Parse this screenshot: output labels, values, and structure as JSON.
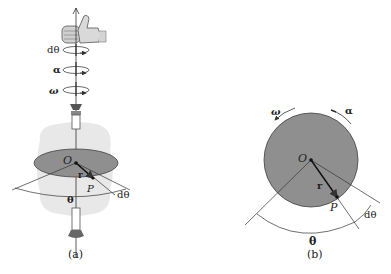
{
  "figure_a": {
    "caption": "(a)",
    "rotation_labels": {
      "dtheta": "dθ",
      "alpha": "α",
      "omega": "ω"
    },
    "point_labels": {
      "center": "O",
      "point": "P",
      "radius": "r"
    },
    "angle_labels": {
      "theta": "θ",
      "dtheta": "dθ"
    }
  },
  "figure_b": {
    "caption": "(b)",
    "arc_labels": {
      "omega": "ω",
      "alpha": "α"
    },
    "point_labels": {
      "center": "O",
      "point": "P",
      "radius": "r"
    },
    "angle_labels": {
      "theta": "θ",
      "dtheta": "dθ"
    }
  },
  "colors": {
    "disk": "#8f8f8f",
    "halo": "#e6e6e6",
    "line": "#333333"
  }
}
